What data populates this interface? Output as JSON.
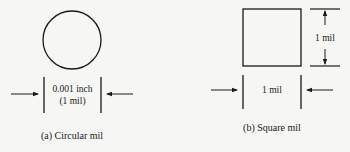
{
  "figure_a": {
    "dimension_line1": "0.001 inch",
    "dimension_line2": "(1 mil)",
    "caption": "(a) Circular mil"
  },
  "figure_b": {
    "side_label": "1 mil",
    "bottom_label": "1 mil",
    "caption": "(b) Square mil"
  },
  "colors": {
    "stroke": "#1a1a1a",
    "background": "#f6f6f4"
  }
}
